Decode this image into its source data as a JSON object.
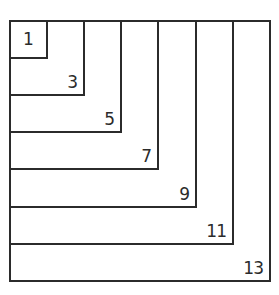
{
  "diagram": {
    "line_color": "#2b2b2b",
    "squares": [
      {
        "label": "1",
        "size_units": 1
      },
      {
        "label": "3",
        "size_units": 2
      },
      {
        "label": "5",
        "size_units": 3
      },
      {
        "label": "7",
        "size_units": 4
      },
      {
        "label": "9",
        "size_units": 5
      },
      {
        "label": "11",
        "size_units": 6
      },
      {
        "label": "13",
        "size_units": 7
      }
    ]
  }
}
